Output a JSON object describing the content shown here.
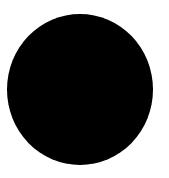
{
  "canvas": {
    "width": 169,
    "height": 178,
    "background": "#ffffff"
  },
  "shape": {
    "type": "circle",
    "fill": "#000000",
    "cx": 80,
    "cy": 89.5,
    "rx": 73,
    "ry": 75.5
  }
}
